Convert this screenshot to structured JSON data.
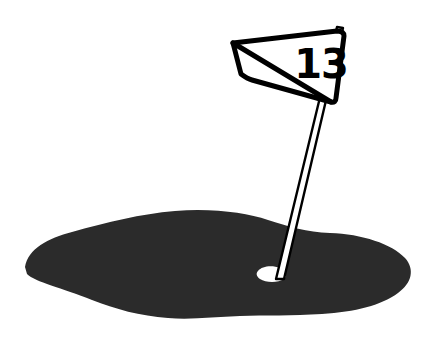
{
  "image": {
    "title": "Golf green with numbered flag",
    "width": 428,
    "height": 356,
    "background_color": "#ffffff",
    "style": "black-and-white clip-art illustration"
  },
  "colors": {
    "background": "#ffffff",
    "green_fill": "#2b2b2b",
    "ink": "#000000",
    "hole_fill": "#ffffff",
    "pole_fill": "#ffffff"
  },
  "flag": {
    "number_label": "13",
    "fill": "#ffffff",
    "outline": "#000000",
    "shape": "pennant"
  },
  "pole": {
    "label": "flagpole",
    "fill": "#ffffff",
    "outline": "#000000"
  },
  "hole": {
    "label": "cup",
    "fill": "#ffffff"
  },
  "green": {
    "label": "putting green",
    "fill": "#2b2b2b"
  },
  "geometry": {
    "green_path": "M 25,267 C 28,249 48,238 72,232 C 108,222 140,214 175,211 C 214,208 246,213 268,220 C 290,227 306,232 330,233 C 362,234 392,244 405,258 C 415,269 412,283 398,293 C 382,305 355,312 322,314 C 292,316 265,315 240,316 C 214,317 190,320 168,318 C 140,316 115,309 92,300 C 62,288 35,282 27,274 Z",
    "flag_path": "M 233,43 L 337,31 C 342,31 344,33 344,36 L 336,98 C 336,101 334,103 331,102 L 252,80 C 248,79 245,77 241,74 Z",
    "flag_bottom_edge": "M 233,43 L 331,102",
    "pole_path": "M 337,27 L 343,28 L 284,279 L 276,279 Z",
    "hole_path": "M 258,271 C 262,266 272,265 280,268 C 286,270 288,275 284,279 C 278,283 266,283 260,279 C 256,276 256,273 258,271 Z",
    "number_position": {
      "x": 321,
      "y": 67
    }
  }
}
